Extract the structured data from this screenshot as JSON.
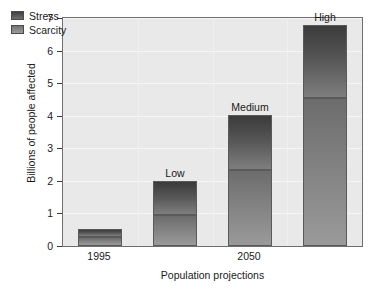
{
  "chart_data": {
    "type": "bar",
    "stacked": true,
    "title": "",
    "xlabel": "Population projections",
    "ylabel": "Billions of people affected",
    "categories": [
      "1995",
      "Low",
      "Medium",
      "High"
    ],
    "x_tick_labels": [
      "1995",
      "2050"
    ],
    "bar_labels": [
      "",
      "Low",
      "Medium",
      "High"
    ],
    "series": [
      {
        "name": "Scarcity",
        "values": [
          0.28,
          0.94,
          2.34,
          4.55
        ]
      },
      {
        "name": "Stress",
        "values": [
          0.24,
          1.06,
          1.69,
          2.25
        ]
      }
    ],
    "totals": [
      0.52,
      2.0,
      4.03,
      6.8
    ],
    "ylim": [
      0,
      7
    ],
    "y_ticks": [
      0,
      1,
      2,
      3,
      4,
      5,
      6,
      7
    ],
    "y_tick_labels": [
      "0",
      "1",
      "2",
      "3",
      "4",
      "5",
      "6",
      "7"
    ],
    "grid": true,
    "legend_position": "top-left",
    "colors": {
      "stress": "#4d4d4d",
      "scarcity": "#8a8a8a",
      "plot_background": "#e9e9e9",
      "axis": "#6f6f6f",
      "gridline": "#f5f5f5",
      "text": "#1a1a1a"
    }
  },
  "legend": {
    "items": [
      {
        "label": "Stress"
      },
      {
        "label": "Scarcity"
      }
    ]
  }
}
